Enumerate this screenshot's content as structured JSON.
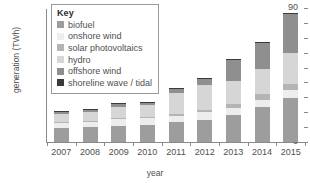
{
  "chart_data": {
    "type": "bar",
    "stacked": true,
    "title": "",
    "xlabel": "year",
    "ylabel": "generation (TWh)",
    "categories": [
      "2007",
      "2008",
      "2009",
      "2010",
      "2011",
      "2012",
      "2013",
      "2014",
      "2015"
    ],
    "ylim": [
      0,
      90
    ],
    "yticks": [
      0,
      10,
      20,
      30,
      40,
      50,
      60,
      70,
      80,
      90
    ],
    "grid": false,
    "legend_title": "Key",
    "legend_position": "top-left-inside",
    "series": [
      {
        "name": "biofuel",
        "color": "#9d9d9d",
        "values": [
          9.3,
          9.8,
          10.8,
          11.5,
          13.2,
          15.0,
          18.2,
          23.3,
          29.8
        ]
      },
      {
        "name": "onshore wind",
        "color": "#ededed",
        "values": [
          4.0,
          4.2,
          5.0,
          4.8,
          4.5,
          5.0,
          4.5,
          5.2,
          5.0
        ]
      },
      {
        "name": "solar photovoltaics",
        "color": "#b4b4b4",
        "values": [
          0.2,
          0.3,
          0.4,
          0.5,
          1.0,
          1.5,
          2.5,
          3.5,
          4.2
        ]
      },
      {
        "name": "hydro",
        "color": "#d6d6d6",
        "values": [
          5.0,
          6.0,
          7.5,
          7.8,
          14.0,
          17.0,
          16.0,
          17.0,
          21.0
        ]
      },
      {
        "name": "offshore wind",
        "color": "#8f8f8f",
        "values": [
          1.8,
          2.0,
          2.0,
          2.2,
          3.0,
          4.2,
          14.5,
          17.8,
          26.0
        ]
      },
      {
        "name": "shoreline wave / tidal",
        "color": "#3a3a3a",
        "values": [
          0.2,
          0.2,
          0.3,
          0.2,
          0.3,
          0.3,
          0.3,
          0.2,
          0.5
        ]
      }
    ],
    "totals": [
      20.5,
      22.5,
      26.0,
      27.0,
      36.0,
      43.0,
      56.0,
      67.0,
      86.5
    ],
    "axis_color": "#8a8a8a",
    "text_color": "#4f4f4f"
  }
}
